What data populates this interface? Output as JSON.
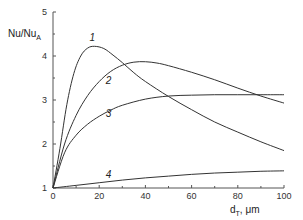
{
  "chart_data": {
    "type": "line",
    "title": "",
    "xlabel": "d_T, μm",
    "ylabel": "Nu/Nu_A",
    "xlim": [
      0,
      100
    ],
    "ylim": [
      1,
      5
    ],
    "grid": false,
    "legend": "inline curve labels",
    "x_ticks": [
      "0",
      "20",
      "40",
      "60",
      "80",
      "100"
    ],
    "y_ticks": [
      "1",
      "2",
      "3",
      "4",
      "5"
    ],
    "series": [
      {
        "name": "1",
        "x": [
          0,
          3,
          6,
          9,
          12,
          15,
          18,
          22,
          26,
          30,
          35,
          40,
          50,
          60,
          70,
          80,
          90,
          100
        ],
        "values": [
          1.0,
          1.9,
          2.9,
          3.6,
          4.0,
          4.18,
          4.22,
          4.17,
          4.02,
          3.85,
          3.62,
          3.42,
          3.08,
          2.78,
          2.5,
          2.27,
          2.05,
          1.85
        ]
      },
      {
        "name": "2",
        "x": [
          0,
          5,
          10,
          15,
          20,
          25,
          30,
          35,
          40,
          45,
          50,
          60,
          70,
          80,
          90,
          100
        ],
        "values": [
          1.0,
          2.0,
          2.65,
          3.1,
          3.42,
          3.65,
          3.79,
          3.86,
          3.87,
          3.84,
          3.78,
          3.63,
          3.46,
          3.27,
          3.09,
          2.93
        ]
      },
      {
        "name": "3",
        "x": [
          0,
          5,
          10,
          15,
          20,
          25,
          30,
          40,
          50,
          60,
          70,
          80,
          90,
          100
        ],
        "values": [
          1.0,
          1.8,
          2.2,
          2.45,
          2.63,
          2.77,
          2.88,
          3.02,
          3.09,
          3.11,
          3.12,
          3.12,
          3.12,
          3.12
        ]
      },
      {
        "name": "4",
        "x": [
          0,
          10,
          20,
          30,
          40,
          50,
          60,
          70,
          80,
          90,
          100
        ],
        "values": [
          1.0,
          1.06,
          1.12,
          1.18,
          1.23,
          1.27,
          1.31,
          1.34,
          1.36,
          1.38,
          1.39
        ]
      }
    ],
    "curve_labels": [
      {
        "text": "1",
        "x": 17,
        "y": 4.35
      },
      {
        "text": "2",
        "x": 24,
        "y": 3.37
      },
      {
        "text": "3",
        "x": 24,
        "y": 2.62
      },
      {
        "text": "4",
        "x": 24,
        "y": 1.23
      }
    ]
  },
  "labels": {
    "ylabel_main": "Nu/Nu",
    "ylabel_sub": "A",
    "xlabel_main": "d",
    "xlabel_sub": "T",
    "xlabel_unit": ", μm"
  }
}
